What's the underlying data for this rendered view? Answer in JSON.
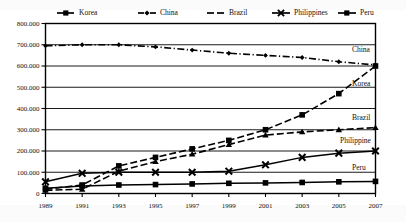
{
  "chart_data": {
    "type": "line",
    "title": "",
    "subtitle": "",
    "xlabel": "",
    "ylabel": "",
    "x": [
      1989,
      1991,
      1993,
      1995,
      1997,
      1999,
      2001,
      2003,
      2005,
      2007
    ],
    "xtick_labels": [
      "1989",
      "1991",
      "1993",
      "1995",
      "1997",
      "1999",
      "2001",
      "2003",
      "2005",
      "2007"
    ],
    "ytick_labels": [
      "0",
      "100.000",
      "200.000",
      "300.000",
      "400.000",
      "500.000",
      "600.000",
      "700.000",
      "800.000"
    ],
    "ytick_values": [
      0,
      100000,
      200000,
      300000,
      400000,
      500000,
      600000,
      700000,
      800000
    ],
    "ylim": [
      0,
      800000
    ],
    "xlim": [
      1989,
      2007
    ],
    "grid": true,
    "legend_position": "top",
    "series": [
      {
        "name": "Korea",
        "marker": "square",
        "dash": "dashed",
        "end_label": "Korea",
        "values": [
          20000,
          40000,
          130000,
          170000,
          210000,
          250000,
          300000,
          370000,
          470000,
          600000
        ]
      },
      {
        "name": "China",
        "marker": "diamond",
        "dash": "dashdot",
        "end_label": "China",
        "values": [
          695000,
          700000,
          700000,
          690000,
          675000,
          660000,
          650000,
          640000,
          620000,
          605000
        ]
      },
      {
        "name": "Brazil",
        "marker": "triangle",
        "dash": "dashed",
        "end_label": "Brazil",
        "values": [
          15000,
          20000,
          105000,
          150000,
          185000,
          230000,
          275000,
          290000,
          300000,
          310000
        ]
      },
      {
        "name": "Philippines",
        "marker": "x",
        "dash": "solid",
        "end_label": "Philippine",
        "values": [
          55000,
          95000,
          100000,
          100000,
          100000,
          105000,
          135000,
          170000,
          190000,
          200000
        ]
      },
      {
        "name": "Peru",
        "marker": "square",
        "dash": "solid",
        "end_label": "Peru",
        "values": [
          25000,
          35000,
          40000,
          42000,
          45000,
          48000,
          50000,
          52000,
          55000,
          57000
        ]
      }
    ],
    "legend": [
      {
        "label": "Korea",
        "marker": "square",
        "dash": "dashed"
      },
      {
        "label": "China",
        "marker": "diamond",
        "dash": "dashdot"
      },
      {
        "label": "Brazil",
        "marker": "none",
        "dash": "dashed"
      },
      {
        "label": "Philippines",
        "marker": "x",
        "dash": "solid"
      },
      {
        "label": "Peru",
        "marker": "square",
        "dash": "solid"
      }
    ],
    "colors": {
      "ink": "#000000",
      "background": "#ffffff"
    }
  }
}
